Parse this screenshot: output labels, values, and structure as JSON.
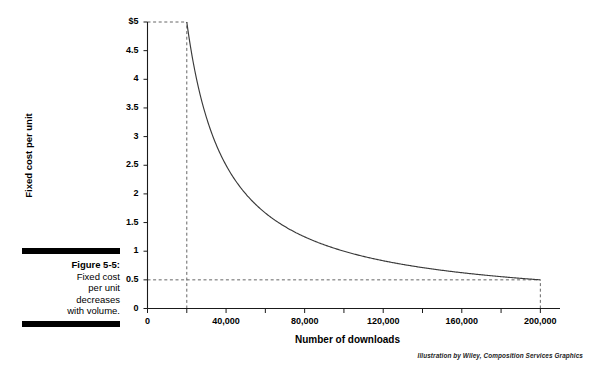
{
  "figure": {
    "number_label": "Figure 5-5:",
    "caption": "Fixed cost per unit decreases with volume.",
    "caption_line1": "Fixed cost",
    "caption_line2": "per unit",
    "caption_line3": "decreases",
    "caption_line4": "with volume.",
    "attribution": "Illustration by Wiley, Composition Services Graphics"
  },
  "colors": {
    "curve": "#3a3a3a",
    "axis": "#1a1a1a",
    "dashed": "#555555",
    "text": "#000000",
    "background": "#ffffff"
  },
  "chart_data": {
    "type": "line",
    "title": "",
    "subtitle": "",
    "xlabel": "Number of downloads",
    "ylabel": "Fixed cost per unit",
    "xlim": [
      0,
      210000
    ],
    "ylim": [
      0,
      5
    ],
    "grid": false,
    "legend": null,
    "formula": "y = 100000 / x",
    "xticks": [
      0,
      20000,
      40000,
      60000,
      80000,
      100000,
      120000,
      140000,
      160000,
      180000,
      200000
    ],
    "xtick_labels": [
      "0",
      "",
      "40,000",
      "",
      "80,000",
      "",
      "120,000",
      "",
      "160,000",
      "",
      "200,000"
    ],
    "yticks": [
      0,
      0.5,
      1,
      1.5,
      2,
      2.5,
      3,
      3.5,
      4,
      4.5,
      5
    ],
    "ytick_labels": [
      "0",
      "0.5",
      "1",
      "1.5",
      "2",
      "2.5",
      "3",
      "3.5",
      "4",
      "4.5",
      "$5"
    ],
    "x": [
      20000,
      25000,
      30000,
      35000,
      40000,
      45000,
      50000,
      55000,
      60000,
      70000,
      80000,
      90000,
      100000,
      110000,
      120000,
      130000,
      140000,
      150000,
      160000,
      170000,
      180000,
      190000,
      200000
    ],
    "y": [
      5.0,
      4.0,
      3.333,
      2.857,
      2.5,
      2.222,
      2.0,
      1.818,
      1.667,
      1.429,
      1.25,
      1.111,
      1.0,
      0.909,
      0.833,
      0.769,
      0.714,
      0.667,
      0.625,
      0.588,
      0.556,
      0.526,
      0.5
    ],
    "annotations": [
      {
        "name": "reference-line-max-cost",
        "type": "dashed-horizontal",
        "y": 5,
        "x_from": 0,
        "x_to": 20000
      },
      {
        "name": "reference-line-min-volume",
        "type": "dashed-vertical",
        "x": 20000,
        "y_from": 0,
        "y_to": 5
      },
      {
        "name": "reference-line-min-cost",
        "type": "dashed-horizontal",
        "y": 0.5,
        "x_from": 0,
        "x_to": 200000
      },
      {
        "name": "reference-line-max-volume",
        "type": "dashed-vertical",
        "x": 200000,
        "y_from": 0,
        "y_to": 0.5
      }
    ]
  }
}
